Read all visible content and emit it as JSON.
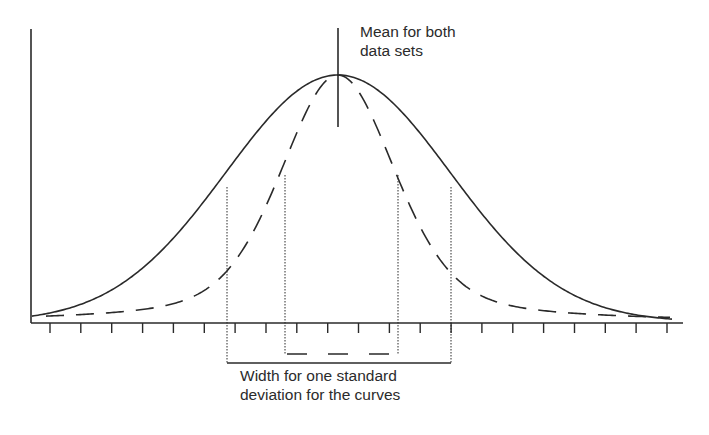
{
  "annotations": {
    "mean_label_line1": "Mean for both",
    "mean_label_line2": "data sets",
    "width_label_line1": "Width for one standard",
    "width_label_line2": "deviation for the curves"
  },
  "colors": {
    "line": "#2a2a2a",
    "background": "#ffffff"
  },
  "chart_data": {
    "type": "line",
    "title": "",
    "xlabel": "",
    "ylabel": "",
    "grid": false,
    "legend": null,
    "x_tick_count": 21,
    "series": [
      {
        "name": "wide distribution",
        "style": "solid",
        "mean": 0,
        "sd": 1.0
      },
      {
        "name": "narrow distribution",
        "style": "dashed",
        "mean": 0,
        "sd": 0.5
      }
    ],
    "annotations": [
      {
        "text": "Mean for both data sets",
        "type": "vertical-line",
        "x": 0
      },
      {
        "text": "Width for one standard deviation for the curves",
        "type": "brackets",
        "wide_sd_range": [
          -1,
          1
        ],
        "narrow_sd_range": [
          -0.5,
          0.5
        ]
      }
    ]
  }
}
